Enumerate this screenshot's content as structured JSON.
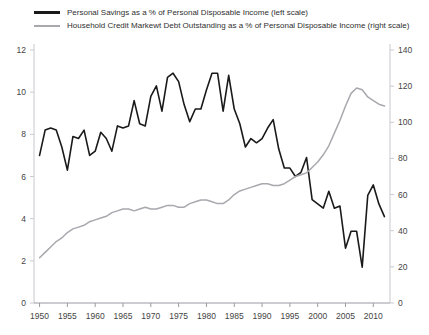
{
  "legend": {
    "position": "top-left",
    "entries": [
      {
        "label": "Personal Savings as a % of Personal Disposable Income (left scale)",
        "color": "#1a1a1a",
        "style": "solid-thick"
      },
      {
        "label": "Household Credit Markewt Debt Outstanding as a % of Personal Disposable Income (right scale)",
        "color": "#a8a8ae",
        "style": "solid-thin"
      }
    ]
  },
  "chart_data": {
    "type": "line",
    "title": "",
    "subtitle": "",
    "xlabel": "",
    "ylabel": "",
    "y2label": "",
    "grid": false,
    "legend_position": "top-left",
    "xlim": [
      1949,
      2013
    ],
    "ylim": [
      0,
      12
    ],
    "y2lim": [
      0,
      140
    ],
    "xticks": [
      1950,
      1955,
      1960,
      1965,
      1970,
      1975,
      1980,
      1985,
      1990,
      1995,
      2000,
      2005,
      2010
    ],
    "yticks_left": [
      0,
      2,
      4,
      6,
      8,
      10,
      12
    ],
    "yticks_right": [
      0,
      20,
      40,
      60,
      80,
      100,
      120,
      140
    ],
    "series": [
      {
        "name": "Personal Savings as a % of Personal Disposable Income (left scale)",
        "axis": "left",
        "color": "#1a1a1a",
        "width": 1.6,
        "x": [
          1950,
          1951,
          1952,
          1953,
          1954,
          1955,
          1956,
          1957,
          1958,
          1959,
          1960,
          1961,
          1962,
          1963,
          1964,
          1965,
          1966,
          1967,
          1968,
          1969,
          1970,
          1971,
          1972,
          1973,
          1974,
          1975,
          1976,
          1977,
          1978,
          1979,
          1980,
          1981,
          1982,
          1983,
          1984,
          1985,
          1986,
          1987,
          1988,
          1989,
          1990,
          1991,
          1992,
          1993,
          1994,
          1995,
          1996,
          1997,
          1998,
          1999,
          2000,
          2001,
          2002,
          2003,
          2004,
          2005,
          2006,
          2007,
          2008,
          2009,
          2010,
          2011,
          2012
        ],
        "y": [
          7.0,
          8.2,
          8.3,
          8.2,
          7.4,
          6.3,
          7.9,
          7.8,
          8.2,
          7.0,
          7.2,
          8.1,
          7.8,
          7.2,
          8.4,
          8.3,
          8.4,
          9.6,
          8.5,
          8.4,
          9.8,
          10.3,
          9.1,
          10.7,
          10.9,
          10.5,
          9.4,
          8.6,
          9.2,
          9.2,
          10.1,
          10.9,
          10.9,
          9.1,
          10.8,
          9.2,
          8.5,
          7.4,
          7.8,
          7.6,
          7.8,
          8.3,
          8.7,
          7.3,
          6.4,
          6.4,
          6.0,
          6.2,
          6.9,
          4.9,
          4.7,
          4.5,
          5.3,
          4.5,
          4.6,
          2.6,
          3.4,
          3.4,
          1.7,
          5.1,
          5.6,
          4.7,
          4.1
        ]
      },
      {
        "name": "Household Credit Markewt Debt Outstanding as a % of Personal Disposable Income (right scale)",
        "axis": "right",
        "color": "#a8a8ae",
        "width": 1.5,
        "x": [
          1950,
          1951,
          1952,
          1953,
          1954,
          1955,
          1956,
          1957,
          1958,
          1959,
          1960,
          1961,
          1962,
          1963,
          1964,
          1965,
          1966,
          1967,
          1968,
          1969,
          1970,
          1971,
          1972,
          1973,
          1974,
          1975,
          1976,
          1977,
          1978,
          1979,
          1980,
          1981,
          1982,
          1983,
          1984,
          1985,
          1986,
          1987,
          1988,
          1989,
          1990,
          1991,
          1992,
          1993,
          1994,
          1995,
          1996,
          1997,
          1998,
          1999,
          2000,
          2001,
          2002,
          2003,
          2004,
          2005,
          2006,
          2007,
          2008,
          2009,
          2010,
          2011,
          2012
        ],
        "y": [
          25,
          28,
          31,
          34,
          36,
          39,
          41,
          42,
          43,
          45,
          46,
          47,
          48,
          50,
          51,
          52,
          52,
          51,
          52,
          53,
          52,
          52,
          53,
          54,
          54,
          53,
          53,
          55,
          56,
          57,
          57,
          56,
          55,
          55,
          57,
          60,
          62,
          63,
          64,
          65,
          66,
          66,
          65,
          65,
          66,
          68,
          70,
          71,
          72,
          75,
          78,
          82,
          87,
          94,
          101,
          109,
          116,
          119,
          118,
          114,
          112,
          110,
          109
        ]
      }
    ]
  }
}
